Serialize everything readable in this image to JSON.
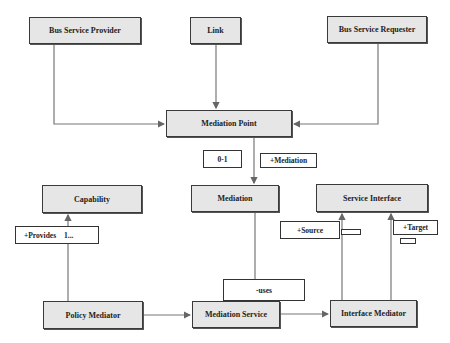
{
  "diagram": {
    "classes": {
      "bus_service_provider": "Bus Service Provider",
      "link": "Link",
      "bus_service_requester": "Bus Service Requester",
      "mediation_point": "Mediation Point",
      "mediation": "Mediation",
      "capability": "Capability",
      "service_interface": "Service Interface",
      "policy_mediator": "Policy Mediator",
      "mediation_service": "Mediation Service",
      "interface_mediator": "Interface Mediator"
    },
    "labels": {
      "multiplicity_0_1": "0-1",
      "mediation_role": "+Mediation",
      "provides_role": "+Provides",
      "provides_multiplicity": "1...",
      "source_role": "+Source",
      "target_role": "+Target",
      "uses_role": "-uses"
    },
    "colors": {
      "box_fill": "#e6e6e6",
      "box_border": "#3a3a3a",
      "line": "#666666"
    }
  }
}
